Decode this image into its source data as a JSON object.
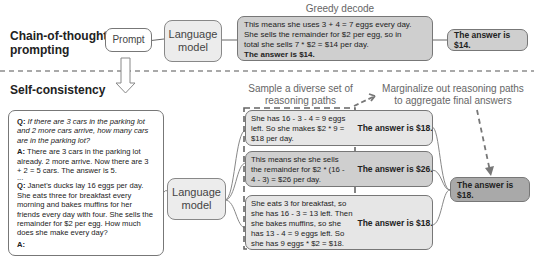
{
  "cot": {
    "section_label": "Chain-of-thought prompting",
    "prompt_label": "Prompt",
    "lm_label": "Language model",
    "caption": "Greedy decode",
    "reasoning_lines": [
      "This means she uses 3 + 4 = 7 eggs every day.",
      "She sells the remainder for $2 per egg, so in",
      "total she sells 7 * $2 = $14 per day."
    ],
    "reasoning_answer": "The answer is $14.",
    "answer": "The answer is $14."
  },
  "sc": {
    "section_label": "Self-consistency",
    "prompt": {
      "q1_label": "Q:",
      "q1_text": "If there are 3 cars in the parking lot and 2 more cars arrive, how many cars are in the parking lot?",
      "a1_label": "A:",
      "a1_text": "There are 3 cars in the parking lot already. 2 more arrive. Now there are 3 + 2 = 5 cars. The answer is 5.",
      "ellipsis": "...",
      "q2_label": "Q:",
      "q2_text": "Janet's ducks lay 16 eggs per day. She eats three for breakfast every morning and bakes muffins for her friends every day with four. She sells the remainder for $2 per egg. How much does she make every day?",
      "a2_label": "A:"
    },
    "lm_label": "Language model",
    "sample_caption": "Sample a diverse set of reasoning paths",
    "marginalize_caption": "Marginalize out reasoning paths to aggregate final answers",
    "paths": [
      {
        "reasoning": "She has 16 - 3 - 4 = 9 eggs left. So she makes $2 * 9 = $18 per day.",
        "answer": "The answer is $18."
      },
      {
        "reasoning": "This means she she sells the remainder for $2 * (16 - 4 - 3) = $26 per day.",
        "answer": "The answer is $26."
      },
      {
        "reasoning": "She eats 3 for breakfast, so she has 16 - 3 = 13 left. Then she bakes muffins, so she has 13 - 4 = 9 eggs left. So she has 9 eggs * $2 = $18.",
        "answer": "The answer is $18."
      }
    ],
    "final_answer": "The answer is $18."
  },
  "colors": {
    "box_light": "#e6e6e6",
    "box_mid": "#cfcfcf",
    "box_dark": "#a9a9a9",
    "border": "#777777",
    "caption_text": "#666666"
  }
}
